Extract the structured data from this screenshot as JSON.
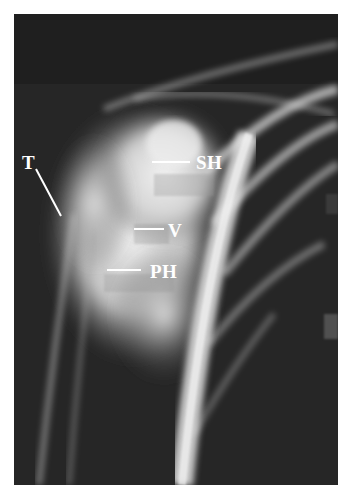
{
  "figure": {
    "type": "radiograph",
    "colors": {
      "background": "#ffffff",
      "film_dark": "#2a2a2a",
      "bone_bright": "#e8e8e8",
      "label": "#ffffff"
    },
    "labels": [
      {
        "id": "T",
        "text": "T"
      },
      {
        "id": "SH",
        "text": "SH"
      },
      {
        "id": "V",
        "text": "V"
      },
      {
        "id": "PH",
        "text": "PH"
      }
    ]
  }
}
